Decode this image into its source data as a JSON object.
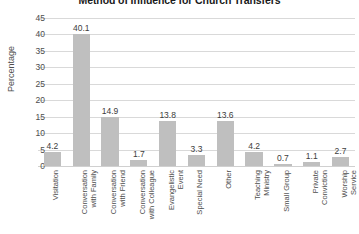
{
  "chart_data": {
    "type": "bar",
    "title": "Method of Influence for Church Transfers",
    "xlabel": "",
    "ylabel": "Percentage",
    "ylim": [
      0,
      45
    ],
    "ytick_step": 5,
    "yticks": [
      45,
      40,
      35,
      30,
      25,
      20,
      15,
      10,
      5,
      0
    ],
    "grid": true,
    "legend": false,
    "bar_color": "#bfbfbf",
    "gridline_color": "#d9d9d9",
    "categories": [
      "Visitation",
      "Conversation with Family",
      "Conversation with Friend",
      "Conversation with Colleague",
      "Evangelistic Event",
      "Special Need",
      "Other",
      "Teaching Ministry",
      "Small Group",
      "Private Conviction",
      "Worship Service"
    ],
    "category_lines": [
      "Visitation",
      "Conversation\nwith Family",
      "Conversation\nwith Friend",
      "Conversation\nwith Colleague",
      "Evangelistic\nEvent",
      "Special Need",
      "Other",
      "Teaching\nMinistry",
      "Small Group",
      "Private\nConviction",
      "Worship\nService"
    ],
    "values": [
      4.2,
      40.1,
      14.9,
      1.7,
      13.8,
      3.3,
      13.6,
      4.2,
      0.7,
      1.1,
      2.7
    ],
    "value_labels": [
      "4.2",
      "40.1",
      "14.9",
      "1.7",
      "13.8",
      "3.3",
      "13.6",
      "4.2",
      "0.7",
      "1.1",
      "2.7"
    ]
  }
}
